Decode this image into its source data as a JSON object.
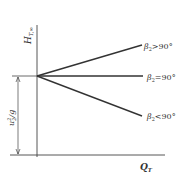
{
  "diagram": {
    "title": "",
    "axes": {
      "y_label_main": "H",
      "y_label_sub": "T,∞",
      "x_label_main": "Q",
      "x_label_sub": "T"
    },
    "dimension": {
      "label_main": "u",
      "label_sup": "2",
      "label_sub": "2",
      "label_tail": "/g"
    },
    "curves": [
      {
        "label_main": "β",
        "label_sub": "2",
        "label_rest": ">90°",
        "slope": "positive"
      },
      {
        "label_main": "β",
        "label_sub": "2",
        "label_rest": "=90°",
        "slope": "zero"
      },
      {
        "label_main": "β",
        "label_sub": "2",
        "label_rest": "<90°",
        "slope": "negative"
      }
    ],
    "colors": {
      "line": "#333333",
      "background": "#ffffff"
    }
  }
}
